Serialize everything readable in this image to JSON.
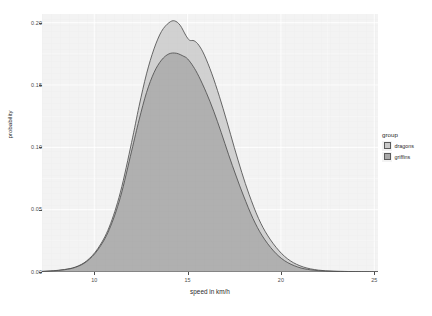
{
  "chart_data": {
    "type": "area",
    "title": "",
    "xlabel": "speed in km/h",
    "ylabel": "probability",
    "xlim": [
      7.2,
      25.2
    ],
    "ylim": [
      0.0,
      0.207
    ],
    "xticks": [
      10,
      15,
      20,
      25
    ],
    "xtick_labels": [
      "10",
      "15",
      "20",
      "25"
    ],
    "yticks": [
      0.0,
      0.05,
      0.1,
      0.15,
      0.2
    ],
    "ytick_labels": [
      "0.00",
      "0.05",
      "0.10",
      "0.15",
      "0.20"
    ],
    "grid": true,
    "legend_position": "right",
    "legend_title": "group",
    "series": [
      {
        "name": "dragons",
        "fill": "#c9c9c9",
        "line": "#4f4f4f",
        "x": [
          7.2,
          7.8,
          8.4,
          9.0,
          9.6,
          10.2,
          10.8,
          11.4,
          12.0,
          12.4,
          12.8,
          13.2,
          13.6,
          14.0,
          14.3,
          14.6,
          14.9,
          15.1,
          15.35,
          15.6,
          15.9,
          16.3,
          16.7,
          17.1,
          17.5,
          17.9,
          18.3,
          18.8,
          19.3,
          19.9,
          20.5,
          21.2,
          22.0,
          22.8,
          23.6,
          24.4,
          25.2
        ],
        "y": [
          0.0005,
          0.001,
          0.002,
          0.004,
          0.009,
          0.019,
          0.036,
          0.064,
          0.104,
          0.133,
          0.159,
          0.179,
          0.193,
          0.2,
          0.2015,
          0.198,
          0.19,
          0.186,
          0.1855,
          0.182,
          0.174,
          0.159,
          0.141,
          0.121,
          0.1,
          0.08,
          0.062,
          0.043,
          0.029,
          0.017,
          0.009,
          0.004,
          0.0015,
          0.0007,
          0.0004,
          0.0002,
          0.0001
        ]
      },
      {
        "name": "griffins",
        "fill": "#a8a8a8",
        "line": "#4f4f4f",
        "x": [
          7.2,
          7.8,
          8.4,
          9.0,
          9.6,
          10.2,
          10.8,
          11.4,
          12.0,
          12.4,
          12.8,
          13.2,
          13.6,
          14.0,
          14.4,
          14.8,
          15.0,
          15.3,
          15.6,
          16.0,
          16.4,
          16.8,
          17.2,
          17.6,
          18.0,
          18.5,
          19.0,
          19.6,
          20.2,
          20.9,
          21.6,
          22.4,
          23.2,
          24.0,
          24.6,
          25.2
        ],
        "y": [
          0.0004,
          0.0009,
          0.0018,
          0.0038,
          0.0085,
          0.018,
          0.034,
          0.06,
          0.097,
          0.122,
          0.144,
          0.16,
          0.17,
          0.175,
          0.1755,
          0.173,
          0.171,
          0.165,
          0.157,
          0.144,
          0.129,
          0.112,
          0.094,
          0.077,
          0.061,
          0.043,
          0.029,
          0.017,
          0.009,
          0.004,
          0.0017,
          0.0007,
          0.0003,
          0.00015,
          0.0001,
          5e-05
        ]
      }
    ]
  },
  "axes": {
    "y_title": "probability",
    "x_title": "speed in km/h"
  },
  "legend": {
    "title": "group",
    "items": [
      {
        "label": "dragons",
        "color": "#c9c9c9"
      },
      {
        "label": "griffins",
        "color": "#a8a8a8"
      }
    ]
  }
}
